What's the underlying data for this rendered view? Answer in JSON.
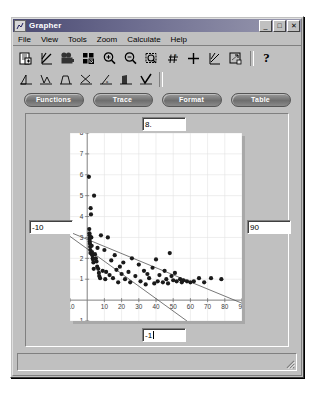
{
  "window": {
    "title": "Grapher",
    "app_icon": "grapher-icon",
    "buttons": [
      {
        "name": "minimize",
        "glyph": "_"
      },
      {
        "name": "maximize",
        "glyph": "□"
      },
      {
        "name": "close",
        "glyph": "✕"
      }
    ]
  },
  "menu": {
    "items": [
      {
        "label": "File",
        "accel": "F"
      },
      {
        "label": "View",
        "accel": "V"
      },
      {
        "label": "Tools",
        "accel": "T"
      },
      {
        "label": "Zoom",
        "accel": "Z"
      },
      {
        "label": "Calculate",
        "accel": "C"
      },
      {
        "label": "Help",
        "accel": "H"
      }
    ]
  },
  "toolbar_primary": {
    "items": [
      {
        "icon": "new-document-icon"
      },
      {
        "icon": "plot-line-icon"
      },
      {
        "icon": "camera-icon"
      },
      {
        "icon": "grid-cells-icon"
      },
      {
        "icon": "zoom-in-icon"
      },
      {
        "icon": "zoom-out-icon"
      },
      {
        "icon": "zoom-box-icon"
      },
      {
        "icon": "summation-icon"
      },
      {
        "icon": "crosshair-icon"
      },
      {
        "icon": "regression-axes-icon"
      },
      {
        "icon": "fit-window-icon"
      },
      {
        "icon": "help-question-icon",
        "label": "?"
      }
    ]
  },
  "toolbar_secondary": {
    "items": [
      {
        "icon": "triangle-plot-icon"
      },
      {
        "icon": "zigzag-plot-icon"
      },
      {
        "icon": "trapezoid-plot-icon"
      },
      {
        "icon": "crossed-plot-icon"
      },
      {
        "icon": "slope-label-icon"
      },
      {
        "icon": "filled-curve-icon"
      },
      {
        "icon": "check-curve-icon"
      }
    ]
  },
  "button_bar": {
    "buttons": [
      {
        "label": "Functions",
        "name": "functions-button"
      },
      {
        "label": "Trace",
        "name": "trace-button"
      },
      {
        "label": "Format",
        "name": "format-button"
      },
      {
        "label": "Table",
        "name": "table-button"
      }
    ]
  },
  "axis_fields": {
    "ymax": {
      "value": "8.",
      "name": "y-max-field"
    },
    "xmin": {
      "value": "-10",
      "name": "x-min-field"
    },
    "xmax": {
      "value": "90",
      "name": "x-max-field"
    },
    "ymin": {
      "value": "-1",
      "name": "y-min-field",
      "caret": true
    }
  },
  "status_bar": {
    "text": ""
  },
  "chart_data": {
    "type": "scatter",
    "title": "",
    "xlabel": "",
    "ylabel": "",
    "xlim": [
      -10,
      90
    ],
    "ylim": [
      -1,
      8
    ],
    "grid": true,
    "legend": "none",
    "xticks": [
      -10,
      10,
      20,
      30,
      40,
      50,
      60,
      70,
      80,
      90
    ],
    "yticks": [
      -1,
      1,
      2,
      3,
      4,
      5,
      6,
      7,
      8
    ],
    "marker": {
      "shape": "circle",
      "color": "#1a1a1a",
      "size": 2.1
    },
    "points": [
      [
        1.0,
        5.9
      ],
      [
        1.2,
        3.4
      ],
      [
        1.3,
        3.2
      ],
      [
        1.4,
        3.1
      ],
      [
        1.5,
        2.95
      ],
      [
        1.5,
        2.8
      ],
      [
        1.6,
        2.7
      ],
      [
        1.7,
        2.55
      ],
      [
        1.8,
        2.4
      ],
      [
        1.9,
        2.25
      ],
      [
        2.0,
        4.4
      ],
      [
        2.2,
        4.1
      ],
      [
        2.4,
        3.0
      ],
      [
        2.6,
        2.6
      ],
      [
        2.8,
        2.3
      ],
      [
        3.0,
        2.15
      ],
      [
        3.2,
        2.0
      ],
      [
        3.4,
        1.95
      ],
      [
        3.6,
        1.8
      ],
      [
        3.8,
        1.5
      ],
      [
        4.0,
        5.0
      ],
      [
        4.5,
        2.2
      ],
      [
        5.0,
        2.0
      ],
      [
        5.4,
        1.85
      ],
      [
        5.8,
        1.6
      ],
      [
        6.0,
        2.5
      ],
      [
        6.4,
        1.5
      ],
      [
        6.8,
        1.3
      ],
      [
        7.0,
        1.15
      ],
      [
        7.5,
        1.05
      ],
      [
        8.0,
        3.1
      ],
      [
        9.0,
        1.4
      ],
      [
        10.0,
        2.4
      ],
      [
        10.5,
        1.0
      ],
      [
        11.0,
        1.35
      ],
      [
        12.0,
        3.0
      ],
      [
        13.0,
        1.2
      ],
      [
        14.0,
        1.9
      ],
      [
        15.0,
        1.05
      ],
      [
        16.0,
        2.15
      ],
      [
        17.0,
        1.45
      ],
      [
        18.0,
        0.85
      ],
      [
        19.0,
        1.6
      ],
      [
        20.0,
        1.25
      ],
      [
        21.0,
        1.8
      ],
      [
        22.0,
        1.0
      ],
      [
        24.0,
        1.35
      ],
      [
        25.0,
        0.85
      ],
      [
        26.0,
        2.0
      ],
      [
        28.0,
        1.15
      ],
      [
        30.0,
        1.7
      ],
      [
        31.0,
        0.9
      ],
      [
        33.0,
        1.4
      ],
      [
        34.0,
        0.75
      ],
      [
        35.0,
        1.25
      ],
      [
        36.0,
        1.05
      ],
      [
        38.0,
        1.55
      ],
      [
        39.0,
        0.8
      ],
      [
        40.0,
        1.95
      ],
      [
        41.0,
        0.9
      ],
      [
        42.0,
        1.2
      ],
      [
        44.0,
        0.85
      ],
      [
        45.0,
        1.4
      ],
      [
        46.0,
        1.0
      ],
      [
        47.0,
        0.8
      ],
      [
        48.0,
        2.25
      ],
      [
        49.0,
        1.15
      ],
      [
        50.0,
        0.95
      ],
      [
        51.0,
        1.3
      ],
      [
        52.0,
        0.9
      ],
      [
        54.0,
        1.0
      ],
      [
        55.0,
        0.85
      ],
      [
        56.0,
        0.95
      ],
      [
        58.0,
        0.9
      ],
      [
        60.0,
        0.85
      ],
      [
        62.0,
        0.9
      ],
      [
        65.0,
        1.05
      ],
      [
        68.0,
        0.85
      ],
      [
        72.0,
        1.05
      ],
      [
        78.0,
        1.0
      ]
    ],
    "fit_lines": [
      {
        "name": "regression-line-upper",
        "x1": -10,
        "y1": 3.25,
        "x2": 90,
        "y2": -0.15,
        "color": "#555555"
      },
      {
        "name": "regression-line-lower",
        "x1": -10,
        "y1": 3.05,
        "x2": 58,
        "y2": -1.0,
        "color": "#555555"
      }
    ]
  }
}
